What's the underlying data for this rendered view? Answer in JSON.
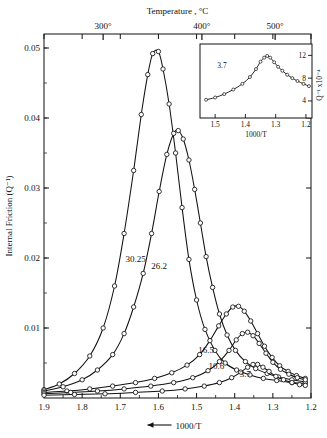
{
  "chart_data": {
    "type": "line",
    "title": "",
    "xlabel": "1000/T",
    "ylabel": "Internal Friction (Q⁻¹)",
    "top_axis_label": "Temperature , °C",
    "xlim": [
      1.9,
      1.2
    ],
    "ylim": [
      0,
      0.052
    ],
    "x_ticks": [
      "1.9",
      "1.8",
      "1.7",
      "1.6",
      "1.5",
      "1.4",
      "1.3",
      "1.2"
    ],
    "y_ticks": [
      "0.05",
      "0.04",
      "0.03",
      "0.02",
      "0.01"
    ],
    "top_ticks": [
      "300°",
      "400°",
      "500°"
    ],
    "top_tick_positions": [
      1.745,
      1.486,
      1.294
    ],
    "grid": false,
    "legend_position": "inline-annotations",
    "series": [
      {
        "name": "30.25",
        "label": "30.25",
        "label_x": 1.66,
        "label_y": 0.0195,
        "points": [
          [
            1.9,
            0.0012
          ],
          [
            1.86,
            0.002
          ],
          [
            1.82,
            0.0035
          ],
          [
            1.78,
            0.006
          ],
          [
            1.745,
            0.01
          ],
          [
            1.715,
            0.016
          ],
          [
            1.69,
            0.0235
          ],
          [
            1.665,
            0.0325
          ],
          [
            1.645,
            0.0405
          ],
          [
            1.628,
            0.0462
          ],
          [
            1.615,
            0.0492
          ],
          [
            1.6,
            0.0495
          ],
          [
            1.588,
            0.047
          ],
          [
            1.572,
            0.042
          ],
          [
            1.555,
            0.035
          ],
          [
            1.538,
            0.0272
          ],
          [
            1.52,
            0.0198
          ],
          [
            1.5,
            0.014
          ],
          [
            1.478,
            0.0098
          ],
          [
            1.452,
            0.0068
          ],
          [
            1.425,
            0.005
          ],
          [
            1.395,
            0.004
          ],
          [
            1.36,
            0.0033
          ],
          [
            1.325,
            0.0028
          ],
          [
            1.29,
            0.0025
          ],
          [
            1.25,
            0.0022
          ],
          [
            1.215,
            0.0021
          ]
        ]
      },
      {
        "name": "26.2",
        "label": "26.2",
        "label_x": 1.598,
        "label_y": 0.0185,
        "points": [
          [
            1.9,
            0.001
          ],
          [
            1.85,
            0.0016
          ],
          [
            1.8,
            0.0026
          ],
          [
            1.76,
            0.004
          ],
          [
            1.72,
            0.0062
          ],
          [
            1.69,
            0.0092
          ],
          [
            1.665,
            0.013
          ],
          [
            1.64,
            0.0178
          ],
          [
            1.618,
            0.0235
          ],
          [
            1.598,
            0.0295
          ],
          [
            1.578,
            0.0348
          ],
          [
            1.56,
            0.0378
          ],
          [
            1.548,
            0.0382
          ],
          [
            1.535,
            0.037
          ],
          [
            1.52,
            0.034
          ],
          [
            1.505,
            0.0298
          ],
          [
            1.49,
            0.025
          ],
          [
            1.475,
            0.0202
          ],
          [
            1.458,
            0.0158
          ],
          [
            1.44,
            0.012
          ],
          [
            1.42,
            0.009
          ],
          [
            1.398,
            0.0068
          ],
          [
            1.372,
            0.0052
          ],
          [
            1.345,
            0.0042
          ],
          [
            1.315,
            0.0035
          ],
          [
            1.285,
            0.003
          ],
          [
            1.25,
            0.0026
          ],
          [
            1.215,
            0.0023
          ]
        ]
      },
      {
        "name": "16.5",
        "label": "16.5",
        "label_x": 1.475,
        "label_y": 0.0065,
        "points": [
          [
            1.9,
            0.0008
          ],
          [
            1.84,
            0.001
          ],
          [
            1.78,
            0.0013
          ],
          [
            1.72,
            0.0017
          ],
          [
            1.66,
            0.0022
          ],
          [
            1.61,
            0.0028
          ],
          [
            1.565,
            0.0036
          ],
          [
            1.525,
            0.0047
          ],
          [
            1.492,
            0.0062
          ],
          [
            1.465,
            0.0082
          ],
          [
            1.442,
            0.0103
          ],
          [
            1.422,
            0.012
          ],
          [
            1.405,
            0.013
          ],
          [
            1.39,
            0.0131
          ],
          [
            1.375,
            0.0124
          ],
          [
            1.358,
            0.011
          ],
          [
            1.34,
            0.0092
          ],
          [
            1.322,
            0.0074
          ],
          [
            1.302,
            0.0058
          ],
          [
            1.282,
            0.0046
          ],
          [
            1.26,
            0.0038
          ],
          [
            1.238,
            0.0032
          ],
          [
            1.215,
            0.0028
          ]
        ]
      },
      {
        "name": "10.6",
        "label": "10.6",
        "label_x": 1.448,
        "label_y": 0.0042,
        "points": [
          [
            1.9,
            0.0006
          ],
          [
            1.83,
            0.0008
          ],
          [
            1.76,
            0.001
          ],
          [
            1.69,
            0.0013
          ],
          [
            1.62,
            0.0017
          ],
          [
            1.56,
            0.0022
          ],
          [
            1.51,
            0.0029
          ],
          [
            1.47,
            0.0039
          ],
          [
            1.44,
            0.0052
          ],
          [
            1.415,
            0.0068
          ],
          [
            1.396,
            0.0083
          ],
          [
            1.38,
            0.0092
          ],
          [
            1.366,
            0.0094
          ],
          [
            1.352,
            0.0089
          ],
          [
            1.336,
            0.0078
          ],
          [
            1.318,
            0.0064
          ],
          [
            1.3,
            0.0051
          ],
          [
            1.28,
            0.0041
          ],
          [
            1.258,
            0.0034
          ],
          [
            1.236,
            0.0029
          ],
          [
            1.215,
            0.0026
          ]
        ]
      },
      {
        "name": "3.7",
        "label": "3.7",
        "label_x": 1.372,
        "label_y": 0.003,
        "points": [
          [
            1.9,
            0.0004
          ],
          [
            1.82,
            0.0005
          ],
          [
            1.74,
            0.0006
          ],
          [
            1.66,
            0.0008
          ],
          [
            1.59,
            0.001
          ],
          [
            1.53,
            0.0013
          ],
          [
            1.48,
            0.0017
          ],
          [
            1.44,
            0.0022
          ],
          [
            1.408,
            0.0029
          ],
          [
            1.384,
            0.0037
          ],
          [
            1.366,
            0.0044
          ],
          [
            1.352,
            0.0048
          ],
          [
            1.34,
            0.0048
          ],
          [
            1.326,
            0.0044
          ],
          [
            1.31,
            0.0038
          ],
          [
            1.292,
            0.0031
          ],
          [
            1.272,
            0.0026
          ],
          [
            1.25,
            0.0022
          ],
          [
            1.23,
            0.0019
          ],
          [
            1.215,
            0.0018
          ]
        ]
      }
    ]
  },
  "inset": {
    "type": "line",
    "xlabel": "1000/T",
    "ylabel": "Q⁻¹ x10⁻⁴",
    "annotation": "3.7",
    "x_ticks": [
      "1.5",
      "1.4",
      "1.3",
      "1.2"
    ],
    "y_ticks": [
      "12",
      "8",
      "4"
    ],
    "xlim": [
      1.55,
      1.18
    ],
    "ylim": [
      1,
      14
    ],
    "points": [
      [
        1.53,
        4.2
      ],
      [
        1.5,
        4.6
      ],
      [
        1.47,
        5.2
      ],
      [
        1.44,
        6.0
      ],
      [
        1.41,
        7.0
      ],
      [
        1.385,
        8.2
      ],
      [
        1.365,
        9.6
      ],
      [
        1.35,
        10.9
      ],
      [
        1.338,
        11.6
      ],
      [
        1.328,
        11.9
      ],
      [
        1.318,
        11.6
      ],
      [
        1.305,
        10.8
      ],
      [
        1.292,
        10.0
      ],
      [
        1.278,
        9.3
      ],
      [
        1.262,
        8.6
      ],
      [
        1.245,
        8.0
      ],
      [
        1.228,
        7.5
      ],
      [
        1.208,
        7.0
      ],
      [
        1.19,
        6.6
      ]
    ]
  },
  "axis_bottom_arrow_label": "1000/T"
}
